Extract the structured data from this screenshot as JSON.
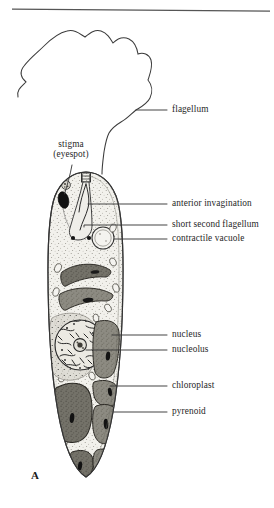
{
  "figure": {
    "panel_letter": "A",
    "top_rule": true
  },
  "labels": {
    "flagellum": "flagellum",
    "stigma_line1": "stigma",
    "stigma_line2": "(eyespot)",
    "anterior_invagination": "anterior invagination",
    "short_second_flagellum": "short second flagellum",
    "contractile_vacuole": "contractile vacuole",
    "nucleus": "nucleus",
    "nucleolus": "nucleolus",
    "chloroplast": "chloroplast",
    "pyrenoid": "pyrenoid"
  },
  "colors": {
    "ink": "#272727",
    "outline": "#3a3a3a",
    "cytoplasm": "#f0efe9",
    "cytoplasm_stipple": "#8f8d85",
    "chloroplast_dark": "#6f6d67",
    "chloroplast_mid": "#8a8880",
    "nucleoplasm": "#d7d5cd",
    "pyrenoid": "#1d1d1d",
    "stigma": "#121212",
    "background": "#ffffff",
    "rule": "#555555"
  },
  "structures": [
    {
      "name": "flagellum",
      "kind": "long-wavy-filament"
    },
    {
      "name": "stigma-eyespot",
      "kind": "dark-oval"
    },
    {
      "name": "anterior-invagination",
      "kind": "reservoir-canal"
    },
    {
      "name": "short-second-flagellum",
      "kind": "short-filament"
    },
    {
      "name": "contractile-vacuole",
      "kind": "circle"
    },
    {
      "name": "nucleus",
      "kind": "large-circle"
    },
    {
      "name": "nucleolus",
      "kind": "inner-circle"
    },
    {
      "name": "chloroplast",
      "kind": "grey-plastid-body"
    },
    {
      "name": "pyrenoid",
      "kind": "dark-slit"
    }
  ]
}
